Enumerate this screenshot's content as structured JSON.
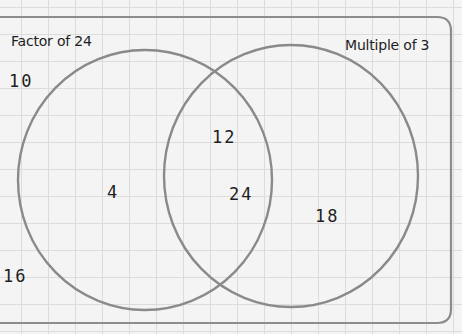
{
  "diagram": {
    "type": "venn",
    "sets": [
      {
        "name": "Factor of 24",
        "only": [
          "4"
        ]
      },
      {
        "name": "Multiple of 3",
        "only": [
          "18"
        ]
      }
    ],
    "intersection": [
      "12",
      "24"
    ],
    "outside": [
      "10",
      "16"
    ],
    "labels": {
      "set_a_title": "Factor of 24",
      "set_b_title": "Multiple of 3",
      "outside_1": "10",
      "outside_2": "16",
      "a_only_1": "4",
      "both_1": "12",
      "both_2": "24",
      "b_only_1": "18"
    },
    "colors": {
      "background": "#f4f4f4",
      "grid": "#dcdcdc",
      "outline": "#8a8a8a",
      "text": "#1e1e1e"
    }
  }
}
